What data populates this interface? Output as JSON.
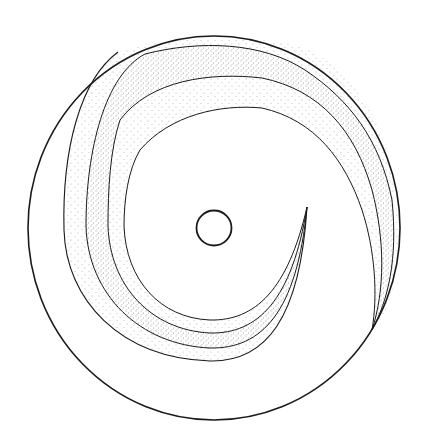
{
  "figure": {
    "width": 423,
    "height": 446,
    "background": "#ffffff",
    "stroke_color": "#1a1a1a",
    "stipple_color": "#555555",
    "outer_circle": {
      "cx": 214,
      "cy": 228,
      "rx": 186,
      "ry": 192,
      "stroke_width": 1.6
    },
    "center_circle": {
      "cx": 214,
      "cy": 228,
      "r": 17.5,
      "stroke_width": 1.8
    },
    "spiral_tip": {
      "x": 307,
      "y": 207
    },
    "curves": [
      {
        "name": "curve-a-outermost",
        "d": "M 118 52 C 80 80 62 150 64 230 C 66 300 120 358 210 361 C 265 362 300 320 307 207"
      },
      {
        "name": "curve-b",
        "d": "M 145 54 C 200 40 262 42 305 70 C 350 100 380 140 392 200 C 398 260 388 300 372 330 M 145 54 C 105 75 86 150 86 226 C 88 295 140 345 210 348 C 262 349 297 312 307 207"
      },
      {
        "name": "curve-c",
        "d": "M 120 120 C 150 80 210 72 262 78 C 320 90 355 130 372 190 C 385 240 385 290 372 330 M 120 120 C 110 150 108 190 108 226 C 110 285 150 330 210 333 C 258 334 292 300 307 207"
      },
      {
        "name": "curve-d-innermost",
        "d": "M 140 150 C 170 115 220 104 262 108 C 315 120 345 160 362 210 C 375 250 378 295 372 330 M 140 150 C 128 170 124 200 124 226 C 126 280 160 318 210 320 C 255 321 288 290 307 207"
      }
    ],
    "bands": [
      {
        "name": "band-outer",
        "density": 0.1,
        "d": "M 118 52 C 160 38 240 32 300 46 C 360 70 398 140 398 230 C 398 290 390 310 372 330 C 388 300 398 260 392 200 C 380 140 350 100 305 70 C 262 42 200 40 145 54 C 105 75 86 150 86 226 C 88 295 140 345 210 348 C 262 349 297 312 307 207 C 300 320 265 362 210 361 C 120 358 66 300 64 230 C 62 150 80 80 118 52 Z"
      },
      {
        "name": "band-middle",
        "density": 0.28,
        "d": "M 145 54 C 200 40 262 42 305 70 C 350 100 380 140 392 200 C 398 260 388 300 372 330 C 385 290 385 240 372 190 C 355 130 320 90 262 78 C 210 72 150 80 120 120 C 110 150 108 190 108 226 C 110 285 150 330 210 333 C 258 334 292 300 307 207 C 297 312 262 349 210 348 C 140 345 88 295 86 226 C 86 150 105 75 145 54 Z"
      },
      {
        "name": "band-inner",
        "density": 0.12,
        "d": "M 120 120 C 150 80 210 72 262 78 C 320 90 355 130 372 190 C 385 240 385 290 372 330 C 378 295 375 250 362 210 C 345 160 315 120 262 108 C 220 104 170 115 140 150 C 128 170 124 200 124 226 C 126 280 160 318 210 320 C 255 321 288 290 307 207 C 292 300 258 334 210 333 C 150 330 110 285 108 226 C 108 190 110 150 120 120 Z"
      }
    ]
  }
}
